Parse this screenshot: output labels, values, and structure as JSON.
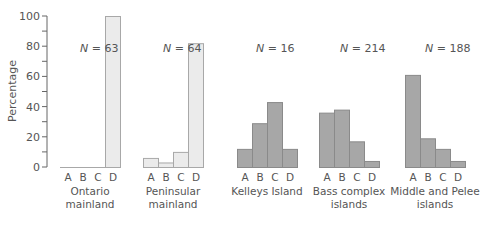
{
  "chart_data": {
    "type": "bar",
    "title": "",
    "xlabel": "",
    "ylabel": "Percentage",
    "ylim": [
      0,
      100
    ],
    "yticks": [
      0,
      20,
      40,
      60,
      80,
      100
    ],
    "grid": false,
    "legend": null,
    "categories": [
      "A",
      "B",
      "C",
      "D"
    ],
    "panels": [
      {
        "name": "Ontario mainland",
        "label_lines": [
          "Ontario",
          "mainland"
        ],
        "n_label": "N = 63",
        "N": 63,
        "style": "light",
        "values": [
          0,
          0,
          0,
          100
        ]
      },
      {
        "name": "Peninsular mainland",
        "label_lines": [
          "Peninsular",
          "mainland"
        ],
        "n_label": "N = 64",
        "N": 64,
        "style": "light",
        "values": [
          6,
          3,
          10,
          82
        ]
      },
      {
        "name": "Kelleys Island",
        "label_lines": [
          "Kelleys Island"
        ],
        "n_label": "N = 16",
        "N": 16,
        "style": "dark",
        "values": [
          12,
          29,
          43,
          12
        ]
      },
      {
        "name": "Bass complex islands",
        "label_lines": [
          "Bass complex",
          "islands"
        ],
        "n_label": "N =  214",
        "N": 214,
        "style": "dark",
        "values": [
          36,
          38,
          17,
          4
        ]
      },
      {
        "name": "Middle and Pelee islands",
        "label_lines": [
          "Middle and Pelee",
          "islands"
        ],
        "n_label": "N = 188",
        "N": 188,
        "style": "dark",
        "values": [
          61,
          19,
          12,
          4
        ]
      }
    ]
  },
  "colors": {
    "light_fill": "#ebebeb",
    "light_stroke": "#a8a8a8",
    "dark_fill": "#a7a7a7",
    "dark_stroke": "#8a8a8a",
    "axis": "#666666",
    "text": "#555555"
  }
}
